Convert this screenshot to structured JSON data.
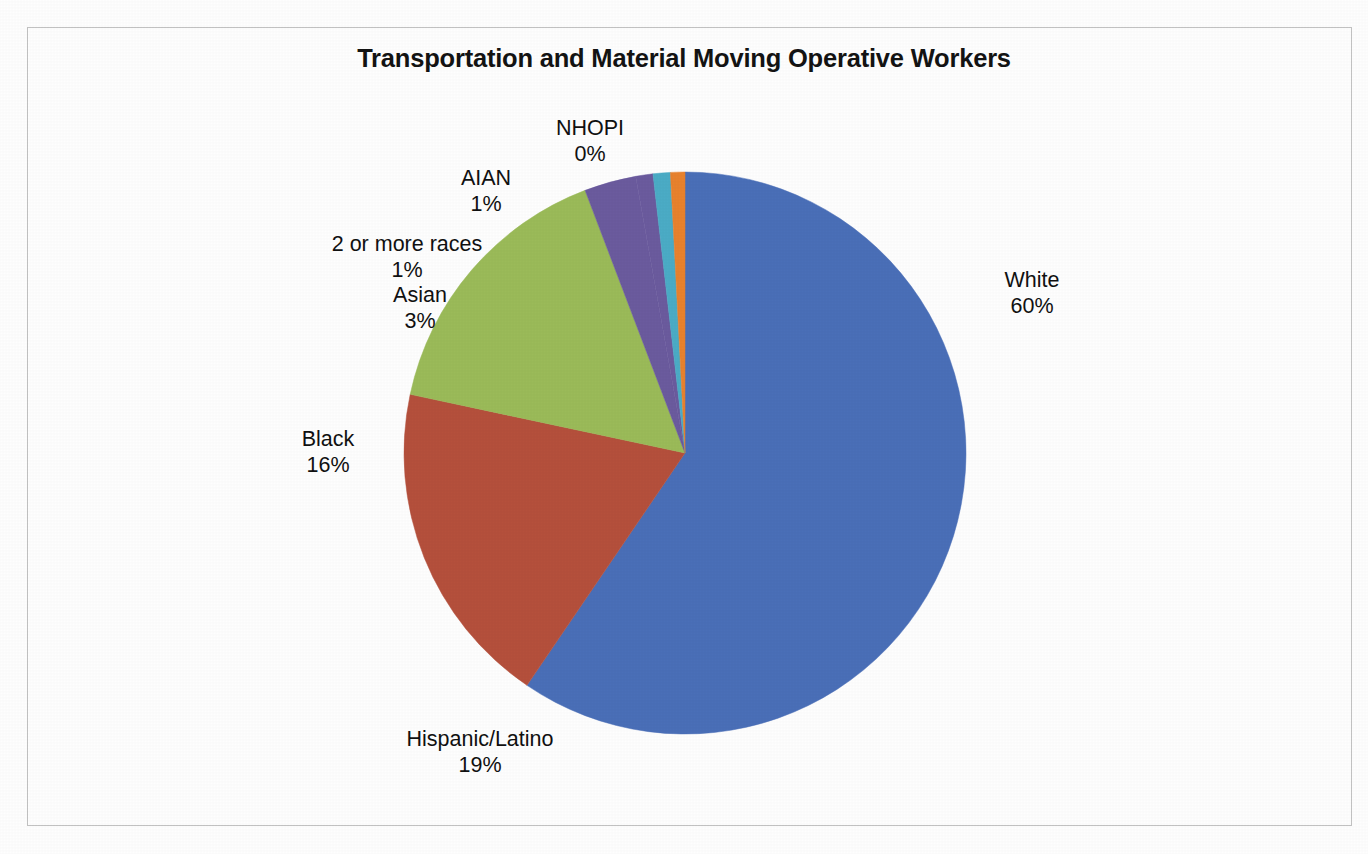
{
  "chart_data": {
    "type": "pie",
    "title": "Transportation and Material Moving Operative Workers",
    "subtitle": "",
    "xlabel": "",
    "ylabel": "",
    "grid": false,
    "legend_position": "none",
    "label_format": "name + percent",
    "start_angle_deg": 0,
    "direction": "clockwise",
    "categories": [
      "White",
      "Hispanic/Latino",
      "Black",
      "Asian",
      "2 or more races",
      "AIAN",
      "NHOPI"
    ],
    "values": [
      60,
      19,
      16,
      3,
      1,
      1,
      0
    ],
    "value_labels": [
      "60%",
      "19%",
      "16%",
      "3%",
      "1%",
      "1%",
      "0%"
    ],
    "colors": [
      "#4A6FB8",
      "#B5503C",
      "#9BBB59",
      "#6B5B9E",
      "#6B5B9E",
      "#4BACC6",
      "#E8822E"
    ],
    "slices": [
      {
        "name": "White",
        "value": 60,
        "value_label": "60%",
        "color": "#4A6FB8",
        "sweep_deg": 216.0
      },
      {
        "name": "Hispanic/Latino",
        "value": 19,
        "value_label": "19%",
        "color": "#B5503C",
        "sweep_deg": 68.4
      },
      {
        "name": "Black",
        "value": 16,
        "value_label": "16%",
        "color": "#9BBB59",
        "sweep_deg": 57.6
      },
      {
        "name": "Asian",
        "value": 3,
        "value_label": "3%",
        "color": "#6B5B9E",
        "sweep_deg": 10.8
      },
      {
        "name": "2 or more races",
        "value": 1,
        "value_label": "1%",
        "color": "#6B5B9E",
        "sweep_deg": 3.6
      },
      {
        "name": "AIAN",
        "value": 1,
        "value_label": "1%",
        "color": "#4BACC6",
        "sweep_deg": 3.6
      },
      {
        "name": "NHOPI",
        "value": 0,
        "value_label": "0%",
        "color": "#E8822E",
        "sweep_deg": 3.0
      }
    ]
  },
  "title": {
    "text": "Transportation and Material Moving Operative Workers"
  },
  "labels": {
    "white": {
      "name": "White",
      "value": "60%"
    },
    "hispanic": {
      "name": "Hispanic/Latino",
      "value": "19%"
    },
    "black": {
      "name": "Black",
      "value": "16%"
    },
    "asian": {
      "name": "Asian",
      "value": "3%"
    },
    "two_or_more": {
      "name": "2 or more races",
      "value": "1%"
    },
    "aian": {
      "name": "AIAN",
      "value": "1%"
    },
    "nhopi": {
      "name": "NHOPI",
      "value": "0%"
    }
  },
  "geometry": {
    "center_x": 685,
    "center_y": 453,
    "radius": 281
  },
  "style": {
    "frame_color": "#c2c2c2",
    "background": "#fefefe",
    "text_color": "#111111"
  }
}
